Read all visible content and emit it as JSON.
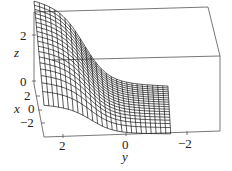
{
  "chart_data": {
    "type": "surface3d",
    "title": "",
    "axes": {
      "x": {
        "label": "x",
        "ticks": [
          "-2",
          "0",
          "2"
        ],
        "range": [
          -3,
          3
        ]
      },
      "y": {
        "label": "y",
        "ticks": [
          "2",
          "0",
          "-2"
        ],
        "range": [
          3,
          -3
        ]
      },
      "z": {
        "label": "z",
        "ticks": [
          "0",
          "2"
        ],
        "range": [
          0,
          3
        ]
      }
    },
    "grid": false,
    "box": true
  },
  "labels": {
    "z_axis": "z",
    "x_axis": "x",
    "y_axis": "y",
    "z_ticks": [
      "2",
      "0"
    ],
    "x_ticks": [
      "2",
      "0",
      "−2"
    ],
    "y_ticks": [
      "2",
      "0",
      "−2"
    ]
  }
}
